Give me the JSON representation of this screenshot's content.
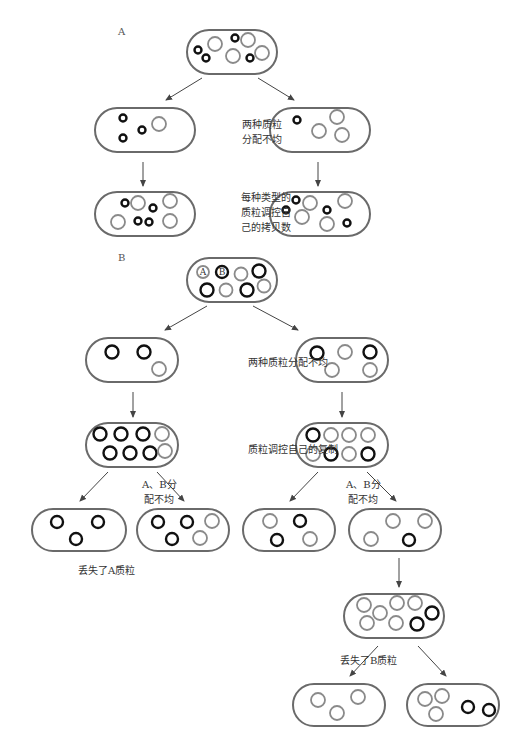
{
  "panels": {
    "A": {
      "letter": "A",
      "x": 118,
      "y": 26
    },
    "B": {
      "letter": "B",
      "x": 118,
      "y": 252
    }
  },
  "labels": [
    {
      "id": "a-uneven",
      "lines": [
        "两种质粒",
        "分配不均"
      ],
      "x": 242,
      "y": 117
    },
    {
      "id": "a-copy-control",
      "lines": [
        "每种类型的",
        "质粒调控自",
        "己的拷贝数"
      ],
      "x": 241,
      "y": 190
    },
    {
      "id": "b-uneven",
      "lines": [
        "两种质粒分配不均"
      ],
      "x": 248,
      "y": 355
    },
    {
      "id": "b-replication",
      "lines": [
        "质粒调控自己的复制"
      ],
      "x": 248,
      "y": 442
    },
    {
      "id": "b-ab-uneven-left",
      "lines": [
        "A、B分",
        "配不均"
      ],
      "x": 142,
      "y": 477
    },
    {
      "id": "b-ab-uneven-right",
      "lines": [
        "A、B分",
        "配不均"
      ],
      "x": 346,
      "y": 477
    },
    {
      "id": "b-lost-a",
      "lines": [
        "丢失了A质粒"
      ],
      "x": 78,
      "y": 563
    },
    {
      "id": "b-lost-b",
      "lines": [
        "丢失了B质粒"
      ],
      "x": 340,
      "y": 653
    }
  ],
  "cells": [
    {
      "id": "A-parent",
      "x": 187,
      "y": 30,
      "w": 90,
      "h": 44,
      "plasmids": [
        {
          "t": "a",
          "x": 198,
          "y": 50,
          "r": 3.5
        },
        {
          "t": "a",
          "x": 206,
          "y": 58,
          "r": 3.5
        },
        {
          "t": "b",
          "x": 215,
          "y": 44,
          "r": 7
        },
        {
          "t": "a",
          "x": 235,
          "y": 38,
          "r": 3.5
        },
        {
          "t": "b",
          "x": 248,
          "y": 40,
          "r": 7
        },
        {
          "t": "b",
          "x": 233,
          "y": 56,
          "r": 7
        },
        {
          "t": "a",
          "x": 250,
          "y": 58,
          "r": 3.5
        },
        {
          "t": "b",
          "x": 262,
          "y": 53,
          "r": 7
        }
      ]
    },
    {
      "id": "A-left",
      "x": 95,
      "y": 108,
      "w": 100,
      "h": 44,
      "plasmids": [
        {
          "t": "a",
          "x": 123,
          "y": 118,
          "r": 3.5
        },
        {
          "t": "a",
          "x": 123,
          "y": 138,
          "r": 3.5
        },
        {
          "t": "a",
          "x": 142,
          "y": 130,
          "r": 3.5
        },
        {
          "t": "b",
          "x": 159,
          "y": 124,
          "r": 7
        }
      ]
    },
    {
      "id": "A-right",
      "x": 270,
      "y": 108,
      "w": 100,
      "h": 44,
      "plasmids": [
        {
          "t": "a",
          "x": 297,
          "y": 120,
          "r": 3.5
        },
        {
          "t": "b",
          "x": 319,
          "y": 131,
          "r": 7
        },
        {
          "t": "b",
          "x": 337,
          "y": 117,
          "r": 7
        },
        {
          "t": "b",
          "x": 342,
          "y": 135,
          "r": 7
        }
      ]
    },
    {
      "id": "A-left-child",
      "x": 95,
      "y": 192,
      "w": 100,
      "h": 44,
      "plasmids": [
        {
          "t": "a",
          "x": 125,
          "y": 203,
          "r": 3.5
        },
        {
          "t": "b",
          "x": 138,
          "y": 203,
          "r": 7
        },
        {
          "t": "a",
          "x": 153,
          "y": 208,
          "r": 3.5
        },
        {
          "t": "b",
          "x": 118,
          "y": 222,
          "r": 7
        },
        {
          "t": "a",
          "x": 138,
          "y": 221,
          "r": 3.5
        },
        {
          "t": "a",
          "x": 149,
          "y": 222,
          "r": 3.5
        },
        {
          "t": "b",
          "x": 170,
          "y": 201,
          "r": 7
        },
        {
          "t": "b",
          "x": 170,
          "y": 221,
          "r": 7
        }
      ]
    },
    {
      "id": "A-right-child",
      "x": 270,
      "y": 192,
      "w": 100,
      "h": 44,
      "plasmids": [
        {
          "t": "a",
          "x": 296,
          "y": 200,
          "r": 3.5
        },
        {
          "t": "a",
          "x": 286,
          "y": 210,
          "r": 3.5
        },
        {
          "t": "b",
          "x": 310,
          "y": 203,
          "r": 7
        },
        {
          "t": "b",
          "x": 302,
          "y": 217,
          "r": 7
        },
        {
          "t": "a",
          "x": 327,
          "y": 210,
          "r": 3.5
        },
        {
          "t": "b",
          "x": 345,
          "y": 201,
          "r": 7
        },
        {
          "t": "b",
          "x": 327,
          "y": 224,
          "r": 7
        },
        {
          "t": "a",
          "x": 347,
          "y": 223,
          "r": 3.5
        }
      ]
    },
    {
      "id": "B-parent",
      "x": 187,
      "y": 258,
      "w": 90,
      "h": 44,
      "plasmids": [
        {
          "t": "b",
          "x": 203,
          "y": 272,
          "r": 6,
          "lbl": "A"
        },
        {
          "t": "a",
          "x": 222,
          "y": 272,
          "r": 6,
          "lbl": "B"
        },
        {
          "t": "b",
          "x": 241,
          "y": 274,
          "r": 6.5
        },
        {
          "t": "a",
          "x": 259,
          "y": 271,
          "r": 6.5
        },
        {
          "t": "a",
          "x": 207,
          "y": 290,
          "r": 6.5
        },
        {
          "t": "b",
          "x": 226,
          "y": 290,
          "r": 6.5
        },
        {
          "t": "a",
          "x": 247,
          "y": 290,
          "r": 6.5
        },
        {
          "t": "b",
          "x": 264,
          "y": 286,
          "r": 6.5
        }
      ]
    },
    {
      "id": "B-left",
      "x": 86,
      "y": 338,
      "w": 92,
      "h": 44,
      "plasmids": [
        {
          "t": "a",
          "x": 112,
          "y": 352,
          "r": 6.5
        },
        {
          "t": "a",
          "x": 144,
          "y": 352,
          "r": 6.5
        },
        {
          "t": "b",
          "x": 159,
          "y": 369,
          "r": 7
        }
      ]
    },
    {
      "id": "B-right",
      "x": 296,
      "y": 338,
      "w": 92,
      "h": 44,
      "plasmids": [
        {
          "t": "a",
          "x": 317,
          "y": 353,
          "r": 6.5
        },
        {
          "t": "b",
          "x": 345,
          "y": 352,
          "r": 7
        },
        {
          "t": "a",
          "x": 370,
          "y": 352,
          "r": 6.5
        },
        {
          "t": "b",
          "x": 332,
          "y": 370,
          "r": 7
        },
        {
          "t": "b",
          "x": 370,
          "y": 370,
          "r": 7
        }
      ]
    },
    {
      "id": "B-left-rep",
      "x": 86,
      "y": 423,
      "w": 92,
      "h": 44,
      "plasmids": [
        {
          "t": "a",
          "x": 100,
          "y": 434,
          "r": 6.5
        },
        {
          "t": "a",
          "x": 121,
          "y": 434,
          "r": 6.5
        },
        {
          "t": "a",
          "x": 143,
          "y": 434,
          "r": 6.5
        },
        {
          "t": "b",
          "x": 162,
          "y": 434,
          "r": 7
        },
        {
          "t": "a",
          "x": 110,
          "y": 453,
          "r": 6.5
        },
        {
          "t": "a",
          "x": 130,
          "y": 453,
          "r": 6.5
        },
        {
          "t": "a",
          "x": 150,
          "y": 453,
          "r": 6.5
        },
        {
          "t": "b",
          "x": 165,
          "y": 451,
          "r": 7
        }
      ]
    },
    {
      "id": "B-right-rep",
      "x": 296,
      "y": 423,
      "w": 92,
      "h": 44,
      "plasmids": [
        {
          "t": "a",
          "x": 313,
          "y": 435,
          "r": 6.5
        },
        {
          "t": "b",
          "x": 331,
          "y": 435,
          "r": 7
        },
        {
          "t": "b",
          "x": 349,
          "y": 435,
          "r": 7
        },
        {
          "t": "b",
          "x": 368,
          "y": 435,
          "r": 7
        },
        {
          "t": "b",
          "x": 313,
          "y": 454,
          "r": 7
        },
        {
          "t": "a",
          "x": 331,
          "y": 454,
          "r": 6.5
        },
        {
          "t": "b",
          "x": 349,
          "y": 454,
          "r": 7
        },
        {
          "t": "a",
          "x": 368,
          "y": 454,
          "r": 6.5
        }
      ]
    },
    {
      "id": "B-LL",
      "x": 32,
      "y": 509,
      "w": 94,
      "h": 42,
      "plasmids": [
        {
          "t": "a",
          "x": 57,
          "y": 522,
          "r": 6
        },
        {
          "t": "a",
          "x": 98,
          "y": 522,
          "r": 6
        },
        {
          "t": "a",
          "x": 76,
          "y": 539,
          "r": 6
        }
      ]
    },
    {
      "id": "B-LR",
      "x": 137,
      "y": 509,
      "w": 92,
      "h": 42,
      "plasmids": [
        {
          "t": "a",
          "x": 158,
          "y": 522,
          "r": 6
        },
        {
          "t": "a",
          "x": 187,
          "y": 522,
          "r": 6
        },
        {
          "t": "b",
          "x": 212,
          "y": 521,
          "r": 7
        },
        {
          "t": "a",
          "x": 172,
          "y": 539,
          "r": 6
        },
        {
          "t": "b",
          "x": 200,
          "y": 538,
          "r": 7
        }
      ]
    },
    {
      "id": "B-RL",
      "x": 243,
      "y": 509,
      "w": 92,
      "h": 42,
      "plasmids": [
        {
          "t": "b",
          "x": 270,
          "y": 521,
          "r": 7
        },
        {
          "t": "a",
          "x": 300,
          "y": 521,
          "r": 6
        },
        {
          "t": "a",
          "x": 277,
          "y": 540,
          "r": 6
        },
        {
          "t": "b",
          "x": 310,
          "y": 539,
          "r": 7
        }
      ]
    },
    {
      "id": "B-RR",
      "x": 349,
      "y": 509,
      "w": 92,
      "h": 42,
      "plasmids": [
        {
          "t": "b",
          "x": 393,
          "y": 521,
          "r": 7
        },
        {
          "t": "b",
          "x": 425,
          "y": 521,
          "r": 7
        },
        {
          "t": "b",
          "x": 371,
          "y": 539,
          "r": 7
        },
        {
          "t": "a",
          "x": 409,
          "y": 540,
          "r": 6
        }
      ]
    },
    {
      "id": "B-RR-rep",
      "x": 344,
      "y": 594,
      "w": 100,
      "h": 44,
      "plasmids": [
        {
          "t": "b",
          "x": 364,
          "y": 605,
          "r": 7
        },
        {
          "t": "b",
          "x": 380,
          "y": 613,
          "r": 7
        },
        {
          "t": "b",
          "x": 397,
          "y": 603,
          "r": 7
        },
        {
          "t": "b",
          "x": 415,
          "y": 603,
          "r": 7
        },
        {
          "t": "b",
          "x": 367,
          "y": 623,
          "r": 7
        },
        {
          "t": "b",
          "x": 396,
          "y": 623,
          "r": 7
        },
        {
          "t": "a",
          "x": 417,
          "y": 624,
          "r": 6.5
        },
        {
          "t": "a",
          "x": 432,
          "y": 613,
          "r": 6.5
        }
      ]
    },
    {
      "id": "B-final-L",
      "x": 293,
      "y": 684,
      "w": 92,
      "h": 42,
      "plasmids": [
        {
          "t": "b",
          "x": 318,
          "y": 700,
          "r": 7
        },
        {
          "t": "b",
          "x": 337,
          "y": 713,
          "r": 7
        },
        {
          "t": "b",
          "x": 358,
          "y": 697,
          "r": 7
        }
      ]
    },
    {
      "id": "B-final-R",
      "x": 407,
      "y": 684,
      "w": 92,
      "h": 42,
      "plasmids": [
        {
          "t": "b",
          "x": 425,
          "y": 699,
          "r": 7
        },
        {
          "t": "b",
          "x": 442,
          "y": 696,
          "r": 7
        },
        {
          "t": "b",
          "x": 436,
          "y": 714,
          "r": 7
        },
        {
          "t": "a",
          "x": 468,
          "y": 707,
          "r": 6
        },
        {
          "t": "a",
          "x": 489,
          "y": 710,
          "r": 6
        }
      ]
    }
  ],
  "arrows": [
    {
      "x1": 202,
      "y1": 78,
      "x2": 166,
      "y2": 100
    },
    {
      "x1": 258,
      "y1": 78,
      "x2": 294,
      "y2": 100
    },
    {
      "x1": 143,
      "y1": 162,
      "x2": 143,
      "y2": 186
    },
    {
      "x1": 318,
      "y1": 162,
      "x2": 318,
      "y2": 186
    },
    {
      "x1": 207,
      "y1": 306,
      "x2": 165,
      "y2": 330
    },
    {
      "x1": 253,
      "y1": 306,
      "x2": 298,
      "y2": 330
    },
    {
      "x1": 133,
      "y1": 392,
      "x2": 133,
      "y2": 417
    },
    {
      "x1": 342,
      "y1": 392,
      "x2": 342,
      "y2": 417
    },
    {
      "x1": 108,
      "y1": 472,
      "x2": 80,
      "y2": 501
    },
    {
      "x1": 157,
      "y1": 472,
      "x2": 184,
      "y2": 501
    },
    {
      "x1": 318,
      "y1": 472,
      "x2": 290,
      "y2": 501
    },
    {
      "x1": 367,
      "y1": 472,
      "x2": 396,
      "y2": 501
    },
    {
      "x1": 399,
      "y1": 558,
      "x2": 399,
      "y2": 587
    },
    {
      "x1": 378,
      "y1": 646,
      "x2": 350,
      "y2": 676
    },
    {
      "x1": 418,
      "y1": 646,
      "x2": 446,
      "y2": 676
    }
  ],
  "colors": {
    "cell_border": "#6a6a6a",
    "plasmid_dark": "#111111",
    "plasmid_light": "#8a8a8a",
    "arrow": "#444444"
  }
}
